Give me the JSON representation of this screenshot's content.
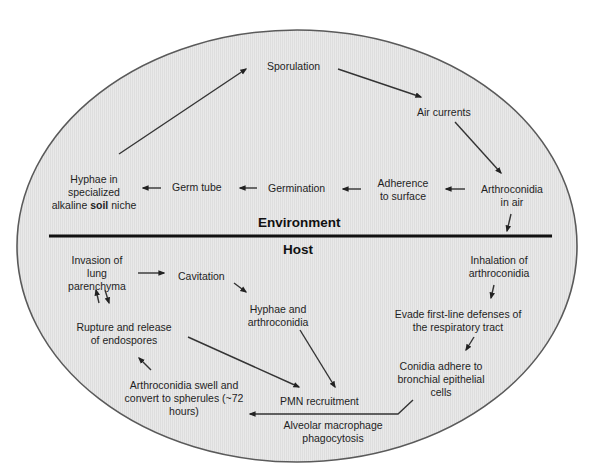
{
  "diagram": {
    "colors": {
      "background": "#ffffff",
      "ellipse_fill": "#e8e8e8",
      "ellipse_stroke": "#555555",
      "divider": "#111111",
      "arrow": "#333333",
      "text": "#1e1e1e"
    },
    "sections": {
      "environment": "Environment",
      "host": "Host"
    },
    "environment_nodes": {
      "sporulation": "Sporulation",
      "air_currents": "Air currents",
      "arthroconidia_in_air": {
        "line1": "Arthroconidia",
        "line2": "in air"
      },
      "adherence": {
        "line1": "Adherence",
        "line2": "to surface"
      },
      "germination": "Germination",
      "germ_tube": "Germ tube",
      "hyphae_soil": {
        "line1": "Hyphae in",
        "line2": "specialized",
        "line3_pre": "alkaline ",
        "line3_bold": "soil",
        "line3_post": " niche"
      }
    },
    "host_nodes": {
      "inhalation": {
        "line1": "Inhalation of",
        "line2": "arthroconidia"
      },
      "evade": {
        "line1": "Evade first-line defenses of",
        "line2": "the respiratory tract"
      },
      "conidia_adhere": {
        "line1": "Conidia adhere to",
        "line2": "bronchial epithelial",
        "line3": "cells"
      },
      "macrophage": {
        "line1": "Alveolar macrophage",
        "line2": "phagocytosis"
      },
      "swell": {
        "line1": "Arthroconidia swell and",
        "line2": "convert to spherules (~72",
        "line3": "hours)"
      },
      "rupture": {
        "line1": "Rupture and release",
        "line2": "of endospores"
      },
      "invasion": {
        "line1": "Invasion of",
        "line2": "lung",
        "line3": "parenchyma"
      },
      "cavitation": "Cavitation",
      "hyphae_arthro": {
        "line1": "Hyphae and",
        "line2": "arthroconidia"
      },
      "pmn": "PMN recruitment"
    }
  }
}
